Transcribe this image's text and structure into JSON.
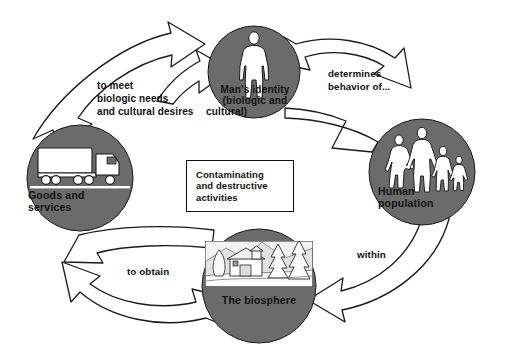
{
  "diagram": {
    "colors": {
      "circle_fill": "#6b6b6b",
      "figure_fill": "#ffffff",
      "outline": "#1a1a1a",
      "background": "#ffffff",
      "text": "#111111"
    },
    "nodes": [
      {
        "id": "mans-identity",
        "label": "Man's identity\n(biologic and\ncultural)",
        "label_lines": [
          "Man's identity",
          "(biologic and",
          "cultural)"
        ],
        "icon": "standing-man-silhouette-icon",
        "cx": 254,
        "cy": 72,
        "r": 46
      },
      {
        "id": "goods-and-services",
        "label": "Goods and\nservices",
        "label_lines": [
          "Goods and",
          "services"
        ],
        "icon": "delivery-truck-icon",
        "cx": 80,
        "cy": 178,
        "r": 53
      },
      {
        "id": "human-population",
        "label": "Human\npopulation",
        "label_lines": [
          "Human",
          "population"
        ],
        "icon": "family-group-silhouette-icon",
        "cx": 422,
        "cy": 172,
        "r": 53
      },
      {
        "id": "the-biosphere",
        "label": "The biosphere",
        "label_lines": [
          "The biosphere"
        ],
        "icon": "house-and-pine-trees-landscape-icon",
        "cx": 259,
        "cy": 286,
        "r": 57
      }
    ],
    "center_box": {
      "id": "contaminating-activities",
      "label": "Contaminating\nand destructive\nactivities",
      "label_lines": [
        "Contaminating",
        "and destructive",
        "activities"
      ],
      "x": 186,
      "y": 160,
      "width": 108,
      "height": 52
    },
    "edges": [
      {
        "id": "goods-to-identity",
        "from": "goods-and-services",
        "to": "mans-identity",
        "label": "to meet\nbiologic needs\nand cultural desires",
        "label_lines": [
          "to meet",
          "biologic needs",
          "and cultural desires"
        ]
      },
      {
        "id": "identity-to-population",
        "from": "mans-identity",
        "to": "human-population",
        "label": "determines\nbehavior of...",
        "label_lines": [
          "determines",
          "behavior of..."
        ]
      },
      {
        "id": "population-to-biosphere",
        "from": "human-population",
        "to": "the-biosphere",
        "label": "within",
        "label_lines": [
          "within"
        ]
      },
      {
        "id": "biosphere-to-goods",
        "from": "the-biosphere",
        "to": "goods-and-services",
        "label": "to obtain",
        "label_lines": [
          "to obtain"
        ]
      }
    ]
  }
}
